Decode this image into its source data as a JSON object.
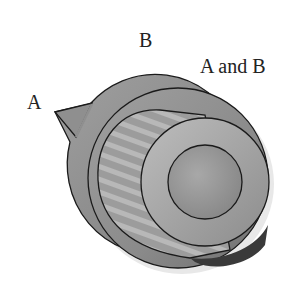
{
  "diagram": {
    "labels": {
      "a": "A",
      "b": "B",
      "a_and_b": "A and B"
    },
    "regions": [
      {
        "id": "A",
        "shape": "outer-disc-with-pointer"
      },
      {
        "id": "B",
        "shape": "striped-cylinder"
      },
      {
        "id": "A and B",
        "shape": "end-face-concentric-circles"
      }
    ],
    "colors": {
      "outer_fill": "#8e8e8e",
      "cylinder_fill": "#9a9a9a",
      "face_fill": "#a6a6a6",
      "inner_fill": "#939393",
      "stroke": "#1a1a1a",
      "shadow": "#3a3a3a"
    }
  }
}
